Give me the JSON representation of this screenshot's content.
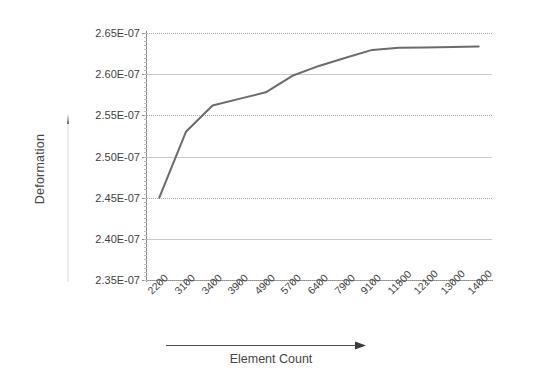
{
  "chart_data": {
    "type": "line",
    "title": "",
    "xlabel": "Element Count",
    "ylabel": "Deformation",
    "categories": [
      "2200",
      "3100",
      "3400",
      "3900",
      "4900",
      "5700",
      "6400",
      "7900",
      "9100",
      "11500",
      "12100",
      "13000",
      "14000"
    ],
    "values": [
      2.45e-07,
      2.53e-07,
      2.562e-07,
      2.57e-07,
      2.578e-07,
      2.598e-07,
      2.61e-07,
      2.62e-07,
      2.6295e-07,
      2.632e-07,
      2.6325e-07,
      2.633e-07,
      2.6335e-07
    ],
    "series": [
      {
        "name": "Deformation",
        "color": "#6b6b6b",
        "values": [
          2.45e-07,
          2.53e-07,
          2.562e-07,
          2.57e-07,
          2.578e-07,
          2.598e-07,
          2.61e-07,
          2.62e-07,
          2.6295e-07,
          2.632e-07,
          2.6325e-07,
          2.633e-07,
          2.6335e-07
        ]
      }
    ],
    "ylim": [
      2.35e-07,
      2.65e-07
    ],
    "ytick_values": [
      2.35e-07,
      2.4e-07,
      2.45e-07,
      2.5e-07,
      2.55e-07,
      2.6e-07,
      2.65e-07
    ],
    "ytick_labels": [
      "2.35E-07",
      "2.40E-07",
      "2.45E-07",
      "2.50E-07",
      "2.55E-07",
      "2.60E-07",
      "2.65E-07"
    ],
    "grid": true,
    "grid_orientation": "horizontal",
    "legend": false,
    "legend_position": "none",
    "xlabel_arrow": "right-arrow",
    "ylabel_arrow": "up-arrow",
    "line_color": "#6b6b6b",
    "grid_color": "#c9c9c9",
    "axis_color": "#8d8d8d",
    "background": "#ffffff"
  },
  "axes": {
    "y_title": "Deformation",
    "x_title": "Element Count"
  }
}
